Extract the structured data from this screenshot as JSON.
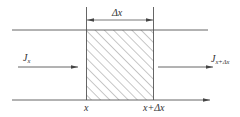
{
  "diagram": {
    "kind": "control-volume flux diagram",
    "labels": {
      "delta_x_top": "Δx",
      "flux_in_main": "J",
      "flux_in_sub": "x",
      "flux_out_main": "J",
      "flux_out_sub": "x+Δx",
      "axis_left": "x",
      "axis_right": "x+Δx"
    },
    "elements": {
      "control_volume": "hatched rectangle between x and x+Δx",
      "flux_in_arrow": "arrow pointing right into control volume",
      "flux_out_arrow": "arrow pointing right out of control volume",
      "x_axis": "horizontal axis arrow at bottom",
      "dimension_arrow": "double-headed arrow indicating width Δx"
    },
    "colors": {
      "stroke": "#555555",
      "hatch": "#777777",
      "text": "#333333",
      "background": "#ffffff"
    }
  }
}
